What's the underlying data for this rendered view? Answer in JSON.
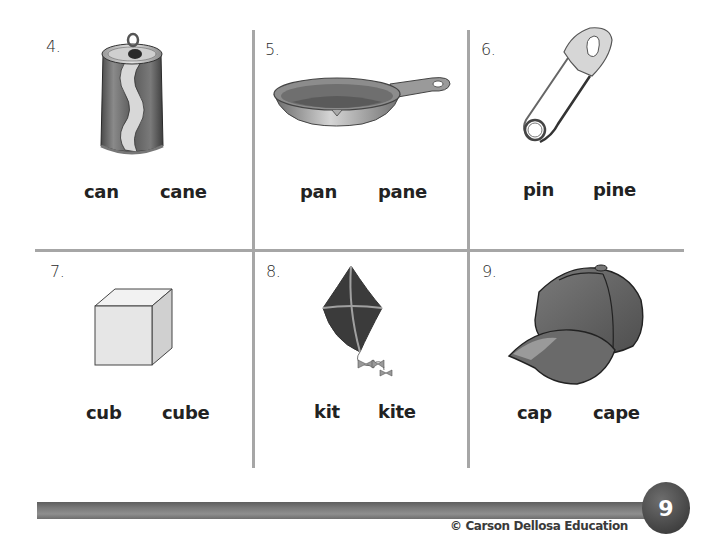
{
  "worksheet": {
    "cells": [
      {
        "number": "4.",
        "picture": "soda-can",
        "words": [
          "can",
          "cane"
        ]
      },
      {
        "number": "5.",
        "picture": "frying-pan",
        "words": [
          "pan",
          "pane"
        ]
      },
      {
        "number": "6.",
        "picture": "safety-pin",
        "words": [
          "pin",
          "pine"
        ]
      },
      {
        "number": "7.",
        "picture": "cube",
        "words": [
          "cub",
          "cube"
        ]
      },
      {
        "number": "8.",
        "picture": "kite",
        "words": [
          "kit",
          "kite"
        ]
      },
      {
        "number": "9.",
        "picture": "baseball-cap",
        "words": [
          "cap",
          "cape"
        ]
      }
    ]
  },
  "footer": {
    "page_number": "9",
    "copyright": "© Carson Dellosa Education"
  },
  "colors": {
    "grid_line": "#a6a6a6",
    "text": "#222222",
    "footer_bar": "#7a7a7a",
    "page_circle": "#4a4a4a"
  }
}
